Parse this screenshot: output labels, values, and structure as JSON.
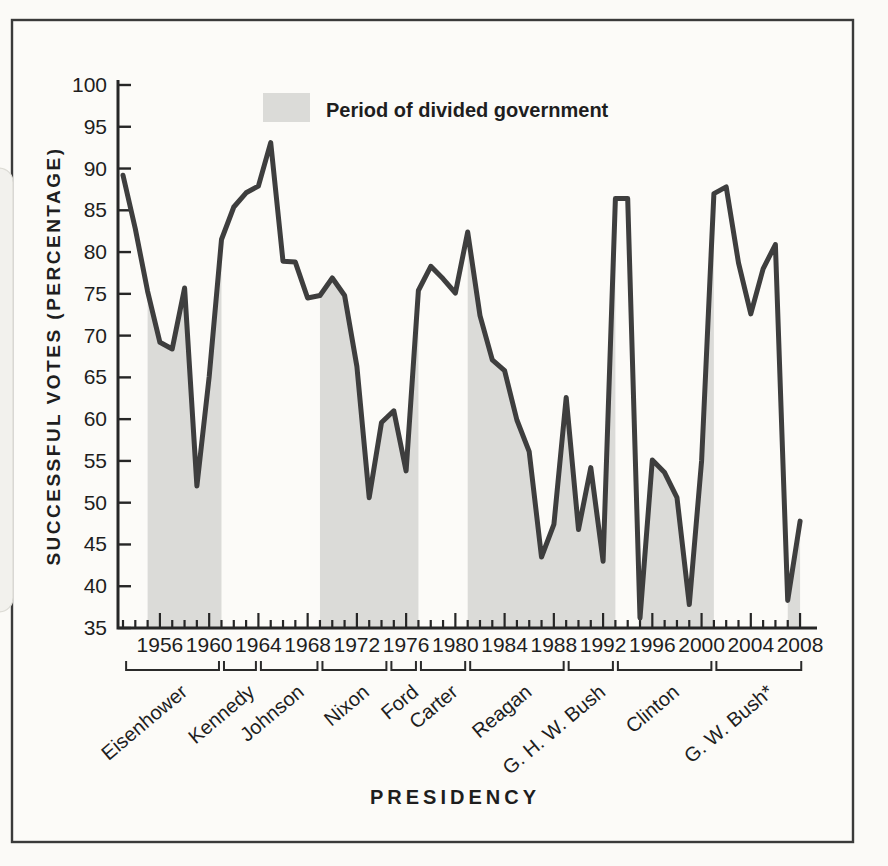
{
  "figure": {
    "clipped_top_text": "PRESIDENTIAL SUCCESS ON CONGRESSIONAL VOTES",
    "legend_label": "Period of divided government",
    "y_axis_title": "SUCCESSFUL VOTES (PERCENTAGE)",
    "x_axis_title": "PRESIDENCY"
  },
  "chart_data": {
    "type": "line",
    "title": "",
    "ylabel": "SUCCESSFUL VOTES (PERCENTAGE)",
    "xlabel": "PRESIDENCY",
    "ylim": [
      35,
      100
    ],
    "ytick_step": 5,
    "x": [
      1953,
      1954,
      1955,
      1956,
      1957,
      1958,
      1959,
      1960,
      1961,
      1962,
      1963,
      1964,
      1965,
      1966,
      1967,
      1968,
      1969,
      1970,
      1971,
      1972,
      1973,
      1974,
      1975,
      1976,
      1977,
      1978,
      1979,
      1980,
      1981,
      1982,
      1983,
      1984,
      1985,
      1986,
      1987,
      1988,
      1989,
      1990,
      1991,
      1992,
      1993,
      1994,
      1995,
      1996,
      1997,
      1998,
      1999,
      2000,
      2001,
      2002,
      2003,
      2004,
      2005,
      2006,
      2007,
      2008
    ],
    "values": [
      89.2,
      82.8,
      75.3,
      69.2,
      68.4,
      75.7,
      52.0,
      65.1,
      81.5,
      85.4,
      87.1,
      87.9,
      93.1,
      78.9,
      78.8,
      74.5,
      74.8,
      76.9,
      74.8,
      66.3,
      50.6,
      59.6,
      61.0,
      53.8,
      75.4,
      78.3,
      76.8,
      75.1,
      82.4,
      72.4,
      67.1,
      65.8,
      59.9,
      56.1,
      43.5,
      47.4,
      62.6,
      46.8,
      54.2,
      43.0,
      86.4,
      86.4,
      36.2,
      55.1,
      53.6,
      50.6,
      37.8,
      55.0,
      87.0,
      87.8,
      78.7,
      72.6,
      78.0,
      80.9,
      38.3,
      47.8
    ],
    "xticks_major": [
      1956,
      1960,
      1964,
      1968,
      1972,
      1976,
      1980,
      1984,
      1988,
      1992,
      1996,
      2000,
      2004,
      2008
    ],
    "legend": {
      "shading_label": "Period of divided government",
      "position": "top-center"
    },
    "shaded_periods": [
      [
        1955,
        1961
      ],
      [
        1969,
        1977
      ],
      [
        1981,
        1993
      ],
      [
        1995,
        2001
      ],
      [
        2007,
        2008.15
      ]
    ],
    "presidents": [
      {
        "name": "Eisenhower",
        "span": [
          1953.05,
          1961
        ]
      },
      {
        "name": "Kennedy",
        "span": [
          1961,
          1964
        ]
      },
      {
        "name": "Johnson",
        "span": [
          1964,
          1969
        ]
      },
      {
        "name": "Nixon",
        "span": [
          1969,
          1974.6
        ]
      },
      {
        "name": "Ford",
        "span": [
          1974.6,
          1977
        ]
      },
      {
        "name": "Carter",
        "span": [
          1977,
          1981
        ]
      },
      {
        "name": "Reagan",
        "span": [
          1981,
          1989
        ]
      },
      {
        "name": "G. H. W. Bush",
        "span": [
          1989,
          1993
        ]
      },
      {
        "name": "Clinton",
        "span": [
          1993,
          2001
        ]
      },
      {
        "name": "G. W. Bush*",
        "span": [
          2001,
          2008.3
        ]
      }
    ],
    "colors": {
      "line": "#3e3e3e",
      "shading": "#dbdbd8",
      "axis": "#262626",
      "box_border": "#3a3a3a",
      "background": "#fbfaf7"
    }
  }
}
